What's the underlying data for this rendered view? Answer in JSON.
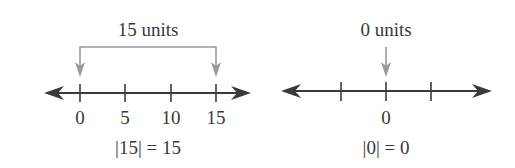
{
  "diagrams": [
    {
      "id": "abs-15",
      "distance_label": "15 units",
      "ticks": [
        "0",
        "5",
        "10",
        "15"
      ],
      "equation": "|15| = 15",
      "arrow_from": "0",
      "arrow_to": "15"
    },
    {
      "id": "abs-0",
      "distance_label": "0 units",
      "ticks": [
        "",
        "0",
        ""
      ],
      "equation": "|0| = 0",
      "arrow_at": "0"
    }
  ],
  "colors": {
    "line": "#3a3a3a",
    "arrow": "#9a9a9a",
    "text": "#3a3a3a"
  }
}
